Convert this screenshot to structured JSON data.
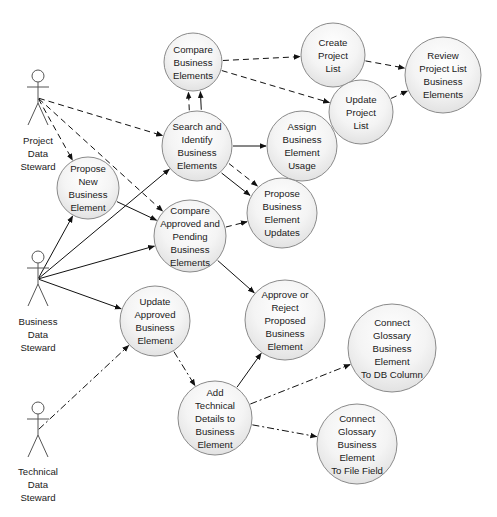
{
  "diagram": {
    "type": "uml-use-case",
    "actors": [
      {
        "id": "pds",
        "label": "Project\nData\nSteward"
      },
      {
        "id": "bds",
        "label": "Business\nData\nSteward"
      },
      {
        "id": "tds",
        "label": "Technical\nData\nSteward"
      }
    ],
    "use_cases": [
      {
        "id": "compare_be",
        "label": "Compare\nBusiness\nElements"
      },
      {
        "id": "create_pl",
        "label": "Create\nProject\nList"
      },
      {
        "id": "review_pl",
        "label": "Review\nProject List\nBusiness\nElements"
      },
      {
        "id": "update_pl",
        "label": "Update\nProject\nList"
      },
      {
        "id": "search_be",
        "label": "Search and\nIdentify\nBusiness\nElements"
      },
      {
        "id": "assign_usage",
        "label": "Assign\nBusiness\nElement\nUsage"
      },
      {
        "id": "propose_new",
        "label": "Propose\nNew\nBusiness\nElement"
      },
      {
        "id": "propose_updates",
        "label": "Propose\nBusiness\nElement\nUpdates"
      },
      {
        "id": "compare_ap",
        "label": "Compare\nApproved and\nPending\nBusiness\nElements"
      },
      {
        "id": "update_approved",
        "label": "Update\nApproved\nBusiness\nElement"
      },
      {
        "id": "approve_reject",
        "label": "Approve or\nReject\nProposed\nBusiness\nElement"
      },
      {
        "id": "add_tech",
        "label": "Add\nTechnical\nDetails to\nBusiness\nElement"
      },
      {
        "id": "connect_db",
        "label": "Connect\nGlossary\nBusiness\nElement\nTo DB Column"
      },
      {
        "id": "connect_file",
        "label": "Connect\nGlossary\nBusiness\nElement\nTo File Field"
      }
    ],
    "links": [
      {
        "from": "pds",
        "to": "search_be",
        "style": "dashed"
      },
      {
        "from": "pds",
        "to": "propose_new",
        "style": "dashed"
      },
      {
        "from": "pds",
        "to": "compare_ap",
        "style": "dashed"
      },
      {
        "from": "search_be",
        "to": "compare_be",
        "style": "dashed"
      },
      {
        "from": "search_be",
        "to": "compare_be",
        "style": "solid",
        "reverse": true
      },
      {
        "from": "compare_be",
        "to": "create_pl",
        "style": "dashed"
      },
      {
        "from": "compare_be",
        "to": "update_pl",
        "style": "dashed"
      },
      {
        "from": "create_pl",
        "to": "review_pl",
        "style": "dashed"
      },
      {
        "from": "update_pl",
        "to": "review_pl",
        "style": "dashed"
      },
      {
        "from": "search_be",
        "to": "assign_usage",
        "style": "solid"
      },
      {
        "from": "search_be",
        "to": "propose_updates",
        "style": "solid"
      },
      {
        "from": "search_be",
        "to": "propose_updates",
        "style": "dashed"
      },
      {
        "from": "compare_ap",
        "to": "propose_updates",
        "style": "dashed"
      },
      {
        "from": "propose_new",
        "to": "compare_ap",
        "style": "solid"
      },
      {
        "from": "bds",
        "to": "propose_new",
        "style": "solid"
      },
      {
        "from": "bds",
        "to": "search_be",
        "style": "solid"
      },
      {
        "from": "bds",
        "to": "compare_ap",
        "style": "solid"
      },
      {
        "from": "bds",
        "to": "update_approved",
        "style": "solid"
      },
      {
        "from": "compare_ap",
        "to": "approve_reject",
        "style": "solid"
      },
      {
        "from": "update_approved",
        "to": "add_tech",
        "style": "dashdot"
      },
      {
        "from": "add_tech",
        "to": "approve_reject",
        "style": "solid"
      },
      {
        "from": "add_tech",
        "to": "connect_db",
        "style": "dashdot"
      },
      {
        "from": "add_tech",
        "to": "connect_file",
        "style": "dashdot"
      },
      {
        "from": "tds",
        "to": "update_approved",
        "style": "dashdot"
      }
    ]
  }
}
